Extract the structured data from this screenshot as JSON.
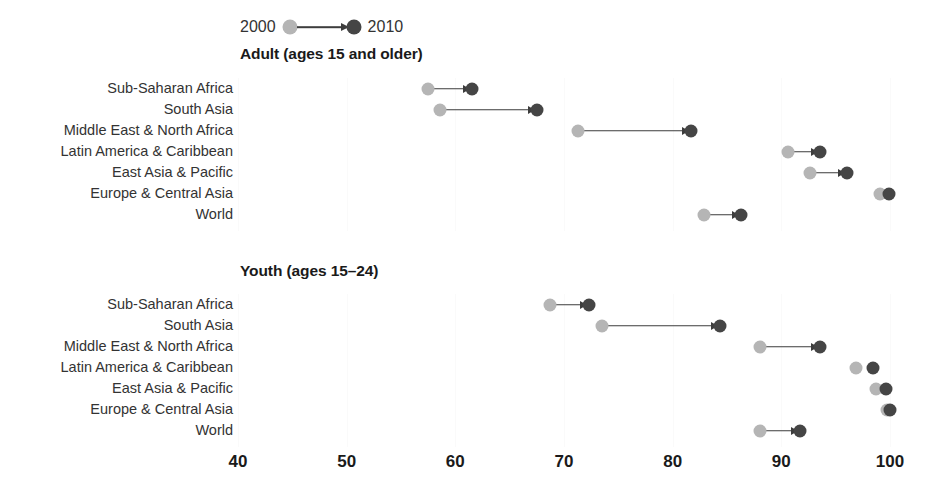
{
  "legend": {
    "start_label": "2000",
    "end_label": "2010",
    "start_color": "#b5b5b5",
    "end_color": "#454545",
    "arrow_icon": "arrow-right-icon"
  },
  "axis": {
    "ticks": [
      "40",
      "50",
      "60",
      "70",
      "80",
      "90",
      "100"
    ],
    "min": 40,
    "max": 100,
    "px_min": 238,
    "px_max": 890
  },
  "panels": [
    {
      "title": "Adult (ages 15 and older)",
      "title_left": 240,
      "title_top": 45,
      "plot_top": 78
    },
    {
      "title": "Youth (ages 15–24)",
      "title_left": 240,
      "title_top": 262,
      "plot_top": 294
    }
  ],
  "chart_data": {
    "type": "scatter",
    "title": "",
    "xlabel": "",
    "ylabel": "",
    "xlim": [
      40,
      100
    ],
    "grid": true,
    "legend_position": "top",
    "series": [
      {
        "name": "2000",
        "color": "#b5b5b5"
      },
      {
        "name": "2010",
        "color": "#454545"
      }
    ],
    "panels": [
      {
        "name": "Adult (ages 15 and older)",
        "categories": [
          "Sub-Saharan Africa",
          "South Asia",
          "Middle East & North Africa",
          "Latin America & Caribbean",
          "East Asia & Pacific",
          "Europe & Central Asia",
          "World"
        ],
        "values_2000": [
          57.5,
          58.6,
          71.3,
          90.6,
          92.6,
          99.1,
          82.9
        ],
        "values_2010": [
          61.5,
          67.5,
          81.7,
          93.6,
          96.0,
          99.9,
          86.3
        ]
      },
      {
        "name": "Youth (ages 15–24)",
        "categories": [
          "Sub-Saharan Africa",
          "South Asia",
          "Middle East & North Africa",
          "Latin America & Caribbean",
          "East Asia & Pacific",
          "Europe & Central Asia",
          "World"
        ],
        "values_2000": [
          68.7,
          73.5,
          88.0,
          96.9,
          98.7,
          99.7,
          88.0
        ],
        "values_2010": [
          72.3,
          84.4,
          93.6,
          98.4,
          99.6,
          100.0,
          91.7
        ]
      }
    ]
  }
}
